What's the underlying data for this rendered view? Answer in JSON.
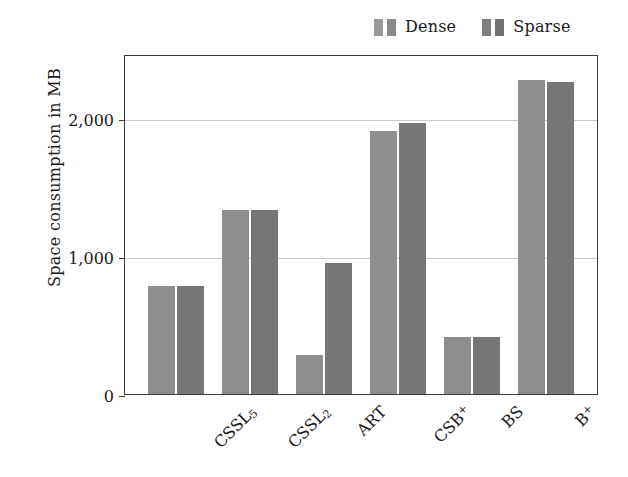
{
  "chart_data": {
    "type": "bar",
    "title": "",
    "subtitle": "",
    "xlabel": "",
    "ylabel": "Space consumption in MB",
    "categories": [
      "CSSL₅",
      "CSSL₂",
      "ART",
      "CSB⁺",
      "BS",
      "B⁺"
    ],
    "series": [
      {
        "name": "Dense",
        "color": "#8e8e8e",
        "values": [
          780,
          1330,
          285,
          1900,
          410,
          2270
        ]
      },
      {
        "name": "Sparse",
        "color": "#767676",
        "values": [
          780,
          1330,
          950,
          1960,
          410,
          2260
        ]
      }
    ],
    "ylim": [
      0,
      2460
    ],
    "yticks": [
      0,
      1000,
      2000
    ],
    "ytick_labels": [
      "0",
      "1,000",
      "2,000"
    ],
    "grid": "horizontal",
    "legend_position": "top-right",
    "bar_orientation": "vertical",
    "xtick_rotation": -45
  },
  "legend": {
    "entries": [
      {
        "label": "Dense",
        "color_light": "#9a9a9a",
        "color_dark": "#8a8a8a"
      },
      {
        "label": "Sparse",
        "color_light": "#7e7e7e",
        "color_dark": "#727272"
      }
    ]
  },
  "axis": {
    "y_title": "Space consumption in MB",
    "tick_0": "0",
    "tick_1000": "1,000",
    "tick_2000": "2,000"
  },
  "xticks": [
    {
      "base": "CSSL",
      "sub": "5",
      "sup": ""
    },
    {
      "base": "CSSL",
      "sub": "2",
      "sup": ""
    },
    {
      "base": "ART",
      "sub": "",
      "sup": ""
    },
    {
      "base": "CSB",
      "sub": "",
      "sup": "+"
    },
    {
      "base": "BS",
      "sub": "",
      "sup": ""
    },
    {
      "base": "B",
      "sub": "",
      "sup": "+"
    }
  ],
  "colors": {
    "frame": "#3b3b3b",
    "grid": "#c9c9c9",
    "background": "#ffffff",
    "text": "#1a1a1a"
  }
}
